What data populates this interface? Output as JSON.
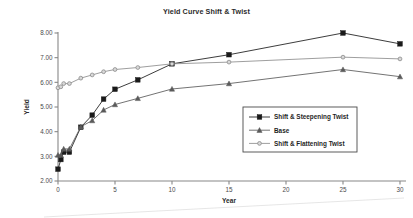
{
  "chart_data": {
    "type": "line",
    "title": "Yield Curve Shift & Twist",
    "xlabel": "Year",
    "ylabel": "Yield",
    "xlim": [
      0,
      30
    ],
    "ylim": [
      2.0,
      8.0
    ],
    "xticks": [
      0,
      5,
      10,
      15,
      20,
      25,
      30
    ],
    "xtick_labels": [
      "0",
      "5",
      "10",
      "15",
      "20",
      "25",
      "30"
    ],
    "yticks": [
      2.0,
      3.0,
      4.0,
      5.0,
      6.0,
      7.0,
      8.0
    ],
    "ytick_labels": [
      "2.00",
      "3.00",
      "4.00",
      "5.00",
      "6.00",
      "7.00",
      "8.00"
    ],
    "grid": false,
    "legend_position": "center-right",
    "x": [
      0,
      0.25,
      0.5,
      1,
      2,
      3,
      4,
      5,
      7,
      10,
      15,
      25,
      30
    ],
    "series": [
      {
        "name": "Shift & Steepening Twist",
        "marker": "square",
        "color": "#1a1a1a",
        "values": [
          2.48,
          2.87,
          3.17,
          3.17,
          4.18,
          4.67,
          5.32,
          5.72,
          6.1,
          6.75,
          7.12,
          8.0,
          7.56
        ]
      },
      {
        "name": "Base",
        "marker": "triangle",
        "color": "#5a5a5a",
        "values": [
          3.05,
          3.05,
          3.3,
          3.3,
          4.2,
          4.45,
          4.88,
          5.1,
          5.35,
          5.73,
          5.95,
          6.52,
          6.23
        ]
      },
      {
        "name": "Shift & Flattening Twist",
        "marker": "circle",
        "color": "#8c8c8c",
        "values": [
          5.78,
          5.82,
          5.95,
          5.95,
          6.17,
          6.3,
          6.43,
          6.52,
          6.6,
          6.75,
          6.82,
          7.02,
          6.95
        ]
      }
    ]
  },
  "colors": {
    "axis": "#888888",
    "title": "#2b2b2b",
    "series_steepening": "#1a1a1a",
    "series_base": "#5a5a5a",
    "series_flattening": "#8c8c8c",
    "legend_border": "#4a4a4a",
    "background": "#ffffff"
  }
}
